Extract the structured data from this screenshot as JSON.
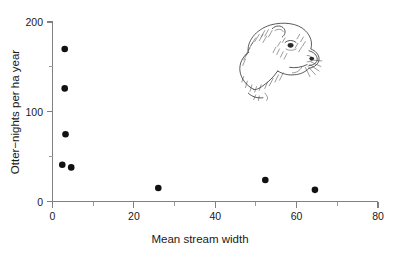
{
  "chart_data": {
    "type": "scatter",
    "title": "",
    "xlabel": "Mean stream width",
    "ylabel": "Otter−nights per ha year",
    "xlim": [
      0,
      80
    ],
    "ylim": [
      0,
      200
    ],
    "xticks": [
      0,
      20,
      40,
      60,
      80
    ],
    "xticklabels": [
      "0",
      "20",
      "40",
      "60",
      "80"
    ],
    "xticks_minor": [
      10,
      30,
      50,
      70
    ],
    "yticks": [
      0,
      100,
      200
    ],
    "yticklabels": [
      "0",
      "100",
      "200"
    ],
    "yticks_minor": [
      50,
      150
    ],
    "grid": false,
    "legend": null,
    "points": [
      {
        "x": 3.0,
        "y": 170
      },
      {
        "x": 3.0,
        "y": 126
      },
      {
        "x": 3.2,
        "y": 75
      },
      {
        "x": 2.4,
        "y": 41
      },
      {
        "x": 4.6,
        "y": 38
      },
      {
        "x": 26.0,
        "y": 15
      },
      {
        "x": 52.3,
        "y": 24
      },
      {
        "x": 64.5,
        "y": 13
      }
    ],
    "annotations": [
      {
        "name": "otter-head-illustration",
        "x": 48,
        "y": 175
      }
    ]
  },
  "axes": {
    "x_title": "Mean stream width",
    "y_title": "Otter−nights per ha year",
    "x_tick_0": "0",
    "x_tick_20": "20",
    "x_tick_40": "40",
    "x_tick_60": "60",
    "x_tick_80": "80",
    "y_tick_0": "0",
    "y_tick_100": "100",
    "y_tick_200": "200"
  },
  "colors": {
    "point": "#111111",
    "axis": "#808080",
    "text": "#1a1a1a",
    "background": "#ffffff",
    "illustration": "#2b2b2b"
  }
}
